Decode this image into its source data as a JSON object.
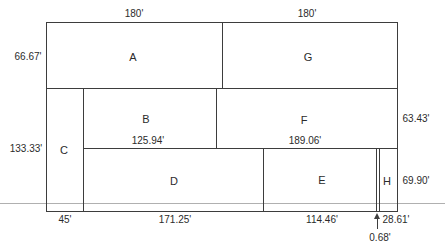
{
  "diagram": {
    "colors": {
      "line": "#3d3d3d",
      "baseline": "#b0b0b0",
      "text": "#2b2b2b",
      "background": "#ffffff"
    },
    "regions": {
      "a": "A",
      "b": "B",
      "c": "C",
      "d": "D",
      "e": "E",
      "f": "F",
      "g": "G",
      "h": "H"
    },
    "dimensions": {
      "top_a": "180'",
      "top_g": "180'",
      "left_upper": "66.67'",
      "left_lower": "133.33'",
      "right_upper": "63.43'",
      "right_lower": "69.90'",
      "inner_b": "125.94'",
      "inner_f": "189.06'",
      "bottom_c": "45'",
      "bottom_d": "171.25'",
      "bottom_e": "114.46'",
      "bottom_h": "28.61'",
      "strip": "0.68'"
    }
  }
}
